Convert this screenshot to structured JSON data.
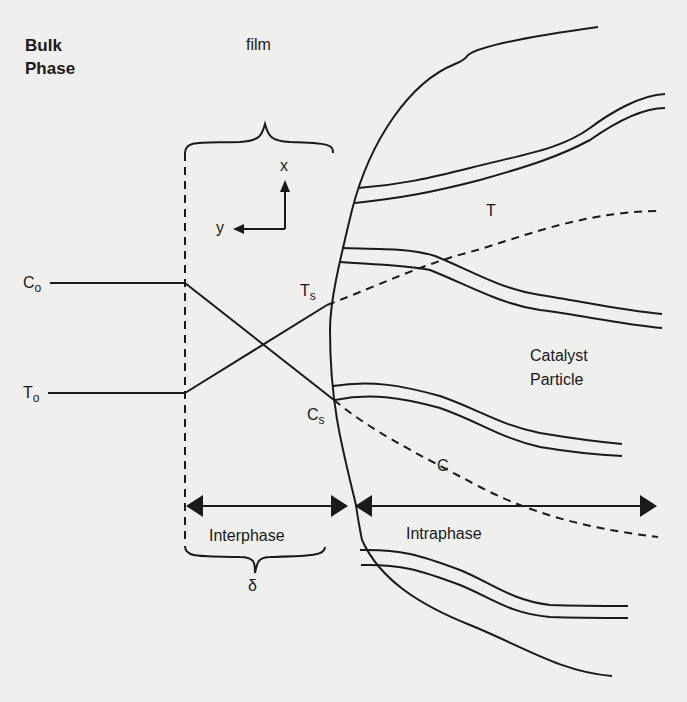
{
  "diagram": {
    "title_block": {
      "line1": "Bulk",
      "line2": "Phase"
    },
    "film_label": "film",
    "axes": {
      "x": "x",
      "y": "y"
    },
    "bulk_values": {
      "concentration": {
        "symbol": "C",
        "subscript": "o"
      },
      "temperature": {
        "symbol": "T",
        "subscript": "o"
      }
    },
    "surface_values": {
      "temperature": {
        "symbol": "T",
        "subscript": "s"
      },
      "concentration": {
        "symbol": "C",
        "subscript": "s"
      }
    },
    "profiles": {
      "temperature_label": "T",
      "concentration_label": "C"
    },
    "particle_label": {
      "line1": "Catalyst",
      "line2": "Particle"
    },
    "regions": {
      "interphase": "Interphase",
      "intraphase": "Intraphase"
    },
    "film_thickness_symbol": "δ",
    "colors": {
      "line": "#1a1a1a",
      "background": "#efefed"
    }
  }
}
